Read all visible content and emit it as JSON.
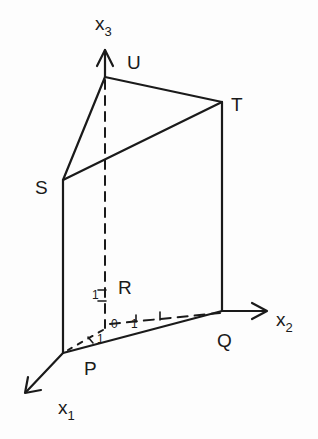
{
  "diagram": {
    "type": "3d-prism-geometry",
    "axes": {
      "x1": {
        "label": "x",
        "subscript": "1"
      },
      "x2": {
        "label": "x",
        "subscript": "2"
      },
      "x3": {
        "label": "x",
        "subscript": "3"
      }
    },
    "vertices": {
      "P": "P",
      "Q": "Q",
      "R": "R",
      "S": "S",
      "T": "T",
      "U": "U"
    },
    "ticks": {
      "origin": "0",
      "x1_unit": "1",
      "x2_unit": "1",
      "x3_unit": "1"
    },
    "colors": {
      "line": "#1a1a1a",
      "background": "#fdfdfd"
    }
  }
}
